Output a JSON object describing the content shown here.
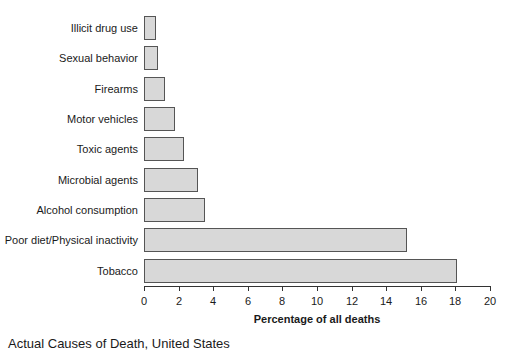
{
  "chart_data": {
    "type": "bar",
    "orientation": "horizontal",
    "title": "Actual Causes of Death, United States",
    "xlabel": "Percentage of all deaths",
    "ylabel": "",
    "xlim": [
      0,
      20
    ],
    "xticks": [
      "0",
      "2",
      "4",
      "6",
      "8",
      "10",
      "12",
      "14",
      "16",
      "18",
      "20"
    ],
    "grid": false,
    "legend": null,
    "categories": [
      "Illicit drug use",
      "Sexual behavior",
      "Firearms",
      "Motor vehicles",
      "Toxic agents",
      "Microbial agents",
      "Alcohol consumption",
      "Poor diet/Physical inactivity",
      "Tobacco"
    ],
    "values": [
      0.7,
      0.8,
      1.2,
      1.8,
      2.3,
      3.1,
      3.5,
      15.2,
      18.1
    ]
  },
  "colors": {
    "bar_fill": "#d8d8d8",
    "bar_border": "#555555"
  }
}
